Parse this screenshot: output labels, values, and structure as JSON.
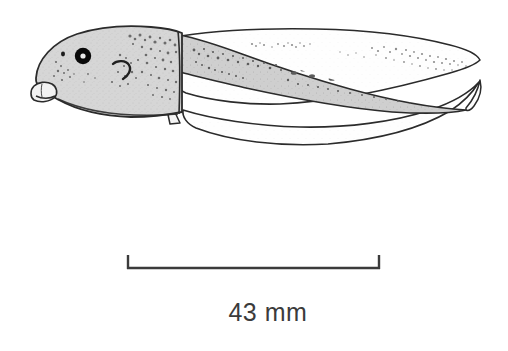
{
  "figure": {
    "background_color": "#ffffff",
    "ink_color": "#2b2b2b",
    "body_fill_color": "#d3d3d3",
    "fin_fill_color": "#fdfdfd",
    "tail_muscle_color": "#c8c8c8",
    "speckle_color": "#6e6e6e",
    "eye_color": "#000000",
    "eye_highlight_color": "#ffffff"
  },
  "scale_bar": {
    "label": "43 mm",
    "value": 43,
    "units": "mm",
    "left_x": 127,
    "right_x": 380,
    "baseline_y": 268,
    "tick_height": 13,
    "line_color": "#3b3b3b",
    "line_width": 2.4
  },
  "anatomy": {
    "parts": [
      {
        "name": "body",
        "label": "Body"
      },
      {
        "name": "eye",
        "label": "Eye"
      },
      {
        "name": "nostril",
        "label": "Nostril"
      },
      {
        "name": "spiracle",
        "label": "Spiracle"
      },
      {
        "name": "oral-disc",
        "label": "Oral disc"
      },
      {
        "name": "vent-tube",
        "label": "Vent tube"
      },
      {
        "name": "tail-muscle",
        "label": "Tail musculature"
      },
      {
        "name": "dorsal-fin",
        "label": "Dorsal fin"
      },
      {
        "name": "ventral-fin",
        "label": "Ventral fin"
      },
      {
        "name": "tail-tip",
        "label": "Tail tip"
      }
    ]
  }
}
